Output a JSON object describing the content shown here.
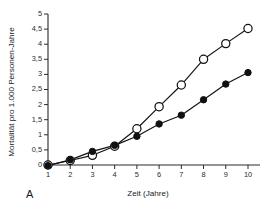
{
  "figure": {
    "panel_letter": "A",
    "background_color": "#ffffff",
    "ink_color": "#111111"
  },
  "chart_data": {
    "type": "line",
    "title": "",
    "subtitle": "",
    "xlabel": "Zeit (Jahre)",
    "ylabel": "Mortalität pro 1.000 Personen-Jahre",
    "x": [
      1,
      2,
      3,
      4,
      5,
      6,
      7,
      8,
      9,
      10
    ],
    "xtick_labels": [
      "1",
      "2",
      "3",
      "4",
      "5",
      "6",
      "7",
      "8",
      "9",
      "10"
    ],
    "ytick_labels": [
      "0",
      "0,5",
      "1",
      "1,5",
      "2",
      "2,5",
      "3",
      "3,5",
      "4",
      "4,5",
      "5"
    ],
    "ytick_values": [
      0,
      0.5,
      1,
      1.5,
      2,
      2.5,
      3,
      3.5,
      4,
      4.5,
      5
    ],
    "xlim": [
      1,
      10
    ],
    "ylim": [
      0,
      5
    ],
    "grid": false,
    "legend": "none",
    "series": [
      {
        "name": "Offene Kreise",
        "marker": "open-circle",
        "values": [
          0.0,
          0.15,
          0.32,
          0.62,
          1.2,
          1.93,
          2.65,
          3.5,
          4.02,
          4.52
        ]
      },
      {
        "name": "Gefüllte Kreise",
        "marker": "filled-circle",
        "values": [
          -0.02,
          0.17,
          0.45,
          0.65,
          0.95,
          1.36,
          1.65,
          2.16,
          2.68,
          3.06
        ]
      }
    ]
  }
}
